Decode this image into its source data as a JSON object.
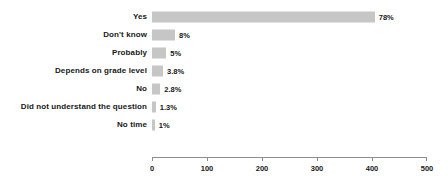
{
  "chart_data": {
    "type": "bar",
    "orientation": "horizontal",
    "title": "",
    "xlabel": "",
    "ylabel": "",
    "xlim": [
      0,
      500
    ],
    "xticks": [
      0,
      100,
      200,
      300,
      400,
      500
    ],
    "xtick_labels": [
      "0",
      "100",
      "200",
      "300",
      "400",
      "500"
    ],
    "grid": false,
    "legend": false,
    "bar_color": "#c6c6c6",
    "text_color": "#181818",
    "axis_color": "#8d8d8d",
    "categories": [
      "Yes",
      "Don't know",
      "Probably",
      "Depends on grade level",
      "No",
      "Did not understand the question",
      "No time"
    ],
    "values": [
      405,
      42,
      26,
      20,
      15,
      7,
      5
    ],
    "data_labels": [
      "78%",
      "8%",
      "5%",
      "3.8%",
      "2.8%",
      "1.3%",
      "1%"
    ],
    "percentages": [
      78,
      8,
      5,
      3.8,
      2.8,
      1.3,
      1
    ],
    "bars": [
      {
        "category": "Yes",
        "value": 405,
        "label": "78%"
      },
      {
        "category": "Don't know",
        "value": 42,
        "label": "8%"
      },
      {
        "category": "Probably",
        "value": 26,
        "label": "5%"
      },
      {
        "category": "Depends on grade level",
        "value": 20,
        "label": "3.8%"
      },
      {
        "category": "No",
        "value": 15,
        "label": "2.8%"
      },
      {
        "category": "Did not understand the question",
        "value": 7,
        "label": "1.3%"
      },
      {
        "category": "No time",
        "value": 5,
        "label": "1%"
      }
    ]
  }
}
